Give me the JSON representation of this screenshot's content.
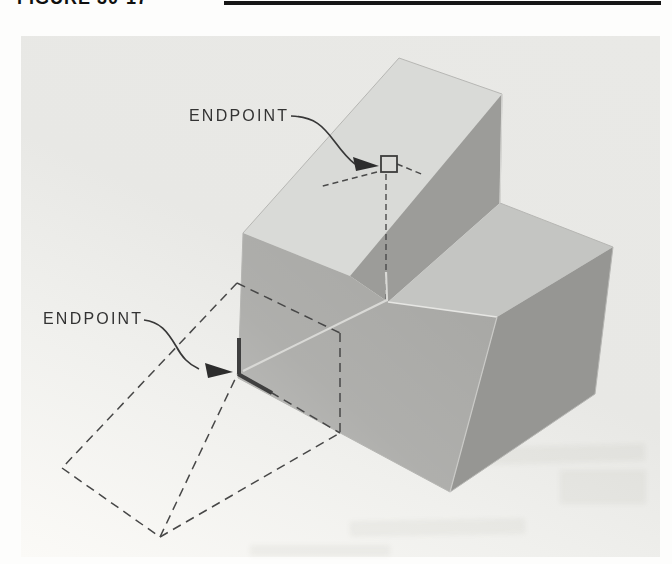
{
  "figure": {
    "caption": "FIGURE 30-17"
  },
  "callouts": {
    "upper": "ENDPOINT",
    "lower": "ENDPOINT"
  },
  "colors": {
    "photo_background": "#e8e8e5",
    "incline_face": "#d9dad7",
    "box_top_face": "#c4c5c2",
    "front_face": "#a8a8a5",
    "wedge_side_face": "#9c9c99",
    "box_side_face": "#969693",
    "annotation_line": "#383838",
    "dashed_line": "#474747",
    "highlight_edge": "#e6e6e3"
  },
  "icons": {
    "osnap_marker": "endpoint-square-marker",
    "ucs_marker": "corner-axes-marker",
    "arrowheads": "leader-arrow"
  }
}
